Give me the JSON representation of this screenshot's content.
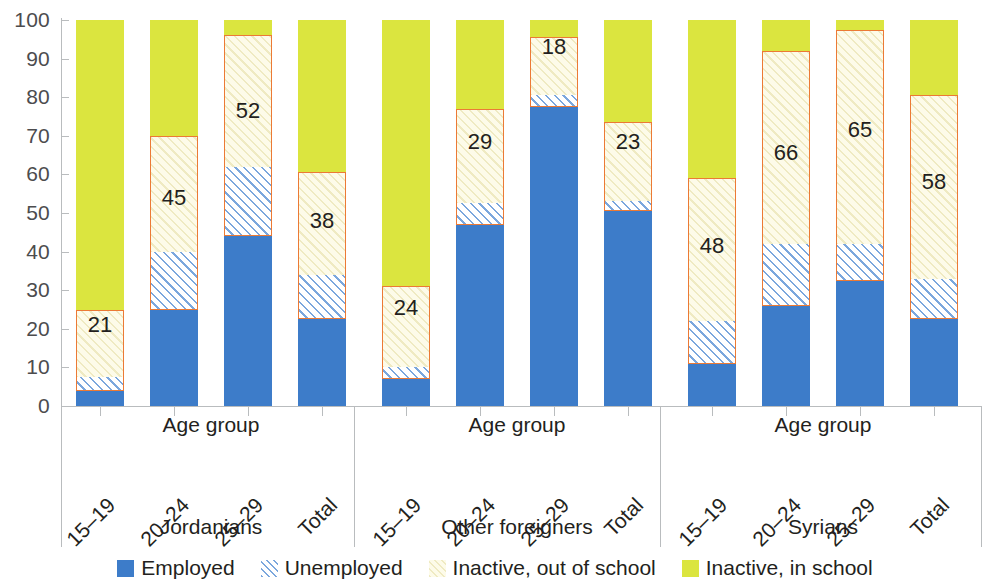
{
  "chart_data": {
    "type": "bar",
    "stacked": true,
    "title": "",
    "xlabel": "Age group",
    "ylabel": "",
    "ylim": [
      0,
      100
    ],
    "yticks": [
      0,
      10,
      20,
      30,
      40,
      50,
      60,
      70,
      80,
      90,
      100
    ],
    "grid": false,
    "legend_position": "bottom",
    "legend": [
      {
        "label": "Employed",
        "key": "employed",
        "color": "#3d7cc9",
        "style": "solid"
      },
      {
        "label": "Unemployed",
        "key": "unemployed",
        "color": "#7ba7dd",
        "style": "hatched-blue"
      },
      {
        "label": "Inactive, out of school",
        "key": "inactive_out_of_school",
        "color": "#fdfbe9",
        "style": "hatched-cream"
      },
      {
        "label": "Inactive, in school",
        "key": "inactive_in_school",
        "color": "#dbe53f",
        "style": "solid"
      }
    ],
    "series": [
      {
        "name": "Employed",
        "values": [
          4,
          25,
          44,
          22.5,
          7,
          47,
          77.5,
          50.5,
          11,
          26,
          32.5,
          22.5
        ]
      },
      {
        "name": "Unemployed",
        "values": [
          3.5,
          15,
          18,
          11.5,
          3,
          5.5,
          3,
          2.5,
          11,
          16,
          9.5,
          10.5
        ]
      },
      {
        "name": "Inactive, out of school",
        "values": [
          17.5,
          30,
          34,
          26.5,
          21,
          24.5,
          15,
          20.5,
          37,
          50,
          55.5,
          47.5
        ]
      },
      {
        "name": "Inactive, in school",
        "values": [
          75,
          30,
          4,
          39.5,
          69,
          23,
          4.5,
          26.5,
          41,
          8,
          2.5,
          19.5
        ]
      }
    ],
    "groups": [
      {
        "name": "Jordanians",
        "axis_title": "Age group",
        "categories": [
          "15–19",
          "20–24",
          "25–29",
          "Total"
        ],
        "bars": [
          {
            "category": "15–19",
            "employed": 4,
            "unemployed": 3.5,
            "inactive_out_of_school": 17.5,
            "inactive_in_school": 75,
            "highlight_label": "21",
            "highlight_from": 4,
            "highlight_to": 25
          },
          {
            "category": "20–24",
            "employed": 25,
            "unemployed": 15,
            "inactive_out_of_school": 30,
            "inactive_in_school": 30,
            "highlight_label": "45",
            "highlight_from": 25,
            "highlight_to": 70
          },
          {
            "category": "25–29",
            "employed": 44,
            "unemployed": 18,
            "inactive_out_of_school": 34,
            "inactive_in_school": 4,
            "highlight_label": "52",
            "highlight_from": 44,
            "highlight_to": 96
          },
          {
            "category": "Total",
            "employed": 22.5,
            "unemployed": 11.5,
            "inactive_out_of_school": 26.5,
            "inactive_in_school": 39.5,
            "highlight_label": "38",
            "highlight_from": 22.5,
            "highlight_to": 60.5
          }
        ]
      },
      {
        "name": "Other foreigners",
        "axis_title": "Age group",
        "categories": [
          "15–19",
          "20–24",
          "25–29",
          "Total"
        ],
        "bars": [
          {
            "category": "15–19",
            "employed": 7,
            "unemployed": 3,
            "inactive_out_of_school": 21,
            "inactive_in_school": 69,
            "highlight_label": "24",
            "highlight_from": 7,
            "highlight_to": 31
          },
          {
            "category": "20–24",
            "employed": 47,
            "unemployed": 5.5,
            "inactive_out_of_school": 24.5,
            "inactive_in_school": 23,
            "highlight_label": "29",
            "highlight_from": 47,
            "highlight_to": 77
          },
          {
            "category": "25–29",
            "employed": 77.5,
            "unemployed": 3,
            "inactive_out_of_school": 15,
            "inactive_in_school": 4.5,
            "highlight_label": "18",
            "highlight_from": 77.5,
            "highlight_to": 95.5
          },
          {
            "category": "Total",
            "employed": 50.5,
            "unemployed": 2.5,
            "inactive_out_of_school": 20.5,
            "inactive_in_school": 26.5,
            "highlight_label": "23",
            "highlight_from": 50.5,
            "highlight_to": 73.5
          }
        ]
      },
      {
        "name": "Syrians",
        "axis_title": "Age group",
        "categories": [
          "15–19",
          "20–24",
          "25–29",
          "Total"
        ],
        "bars": [
          {
            "category": "15–19",
            "employed": 11,
            "unemployed": 11,
            "inactive_out_of_school": 37,
            "inactive_in_school": 41,
            "highlight_label": "48",
            "highlight_from": 11,
            "highlight_to": 59
          },
          {
            "category": "20–24",
            "employed": 26,
            "unemployed": 16,
            "inactive_out_of_school": 50,
            "inactive_in_school": 8,
            "highlight_label": "66",
            "highlight_from": 26,
            "highlight_to": 92
          },
          {
            "category": "25–29",
            "employed": 32.5,
            "unemployed": 9.5,
            "inactive_out_of_school": 55.5,
            "inactive_in_school": 2.5,
            "highlight_label": "65",
            "highlight_from": 32.5,
            "highlight_to": 97.5
          },
          {
            "category": "Total",
            "employed": 22.5,
            "unemployed": 10.5,
            "inactive_out_of_school": 47.5,
            "inactive_in_school": 19.5,
            "highlight_label": "58",
            "highlight_from": 22.5,
            "highlight_to": 80.5
          }
        ]
      }
    ],
    "colors": {
      "employed": "#3d7cc9",
      "unemployed": "#7ba7dd",
      "inactive_out_of_school": "#fdfbe9",
      "inactive_in_school": "#dbe53f",
      "highlight_outline": "#ec7a35",
      "axis": "#b9bcbe",
      "text": "#231f20"
    }
  }
}
